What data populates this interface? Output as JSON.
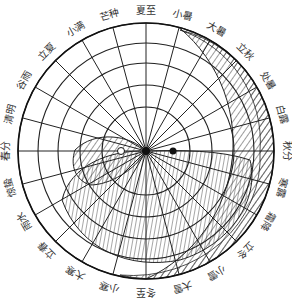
{
  "diagram": {
    "center": [
      146,
      151
    ],
    "radius": 128,
    "rings": [
      128,
      108,
      88,
      66,
      44
    ],
    "label_radius": 140,
    "solar_terms": [
      {
        "name": "夏至",
        "angle": 90
      },
      {
        "name": "小暑",
        "angle": 75
      },
      {
        "name": "大暑",
        "angle": 60
      },
      {
        "name": "立秋",
        "angle": 45
      },
      {
        "name": "处暑",
        "angle": 30
      },
      {
        "name": "白露",
        "angle": 15
      },
      {
        "name": "秋分",
        "angle": 0
      },
      {
        "name": "寒露",
        "angle": -15
      },
      {
        "name": "霜降",
        "angle": -30
      },
      {
        "name": "立冬",
        "angle": -45
      },
      {
        "name": "小雪",
        "angle": -60
      },
      {
        "name": "大雪",
        "angle": -75
      },
      {
        "name": "冬至",
        "angle": -90
      },
      {
        "name": "小寒",
        "angle": -105
      },
      {
        "name": "大寒",
        "angle": -120
      },
      {
        "name": "立春",
        "angle": -135
      },
      {
        "name": "雨水",
        "angle": -150
      },
      {
        "name": "惊蛰",
        "angle": -165
      },
      {
        "name": "春分",
        "angle": 180
      },
      {
        "name": "清明",
        "angle": 165
      },
      {
        "name": "谷雨",
        "angle": 150
      },
      {
        "name": "立夏",
        "angle": 135
      },
      {
        "name": "小满",
        "angle": 120
      },
      {
        "name": "芒种",
        "angle": 105
      }
    ],
    "dots": {
      "yang_eye": "white",
      "yin_eye": "black"
    },
    "colors": {
      "line": "#222222",
      "background": "#ffffff"
    }
  }
}
